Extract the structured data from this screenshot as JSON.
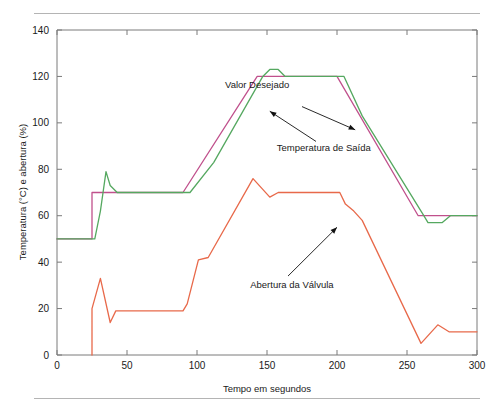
{
  "figure": {
    "rule_top_label": "top-divider",
    "rule_bottom_label": "bottom-divider"
  },
  "chart_data": {
    "type": "line",
    "title": "",
    "xlabel": "Tempo em segundos",
    "ylabel": "Temperatura (°C) e abertura (%)",
    "xlim": [
      0,
      300
    ],
    "ylim": [
      0,
      140
    ],
    "xticks": [
      0,
      50,
      100,
      150,
      200,
      250,
      300
    ],
    "yticks": [
      0,
      20,
      40,
      60,
      80,
      100,
      120,
      140
    ],
    "xtick_labels": [
      "0",
      "50",
      "100",
      "150",
      "200",
      "250",
      "300"
    ],
    "ytick_labels": [
      "0",
      "20",
      "40",
      "60",
      "80",
      "100",
      "120",
      "140"
    ],
    "grid": false,
    "legend": "none (inline annotations with arrows)",
    "series": [
      {
        "name": "Valor Desejado",
        "color": "#c0508c",
        "points": [
          [
            0,
            50
          ],
          [
            25,
            50
          ],
          [
            25,
            70
          ],
          [
            90,
            70
          ],
          [
            143,
            120
          ],
          [
            200,
            120
          ],
          [
            258,
            60
          ],
          [
            300,
            60
          ]
        ]
      },
      {
        "name": "Temperatura de Saída",
        "color": "#55a860",
        "points": [
          [
            0,
            50
          ],
          [
            27,
            50
          ],
          [
            31,
            62
          ],
          [
            35,
            79
          ],
          [
            38,
            73
          ],
          [
            43,
            70
          ],
          [
            95,
            70
          ],
          [
            112,
            83
          ],
          [
            147,
            120
          ],
          [
            152,
            123
          ],
          [
            158,
            123
          ],
          [
            163,
            120
          ],
          [
            205,
            120
          ],
          [
            218,
            103
          ],
          [
            262,
            60
          ],
          [
            265,
            57
          ],
          [
            275,
            57
          ],
          [
            281,
            60
          ],
          [
            300,
            60
          ]
        ]
      },
      {
        "name": "Abertura da Válvula",
        "color": "#e8694a",
        "points": [
          [
            25,
            0
          ],
          [
            25,
            20
          ],
          [
            31,
            33
          ],
          [
            38,
            14
          ],
          [
            42,
            19
          ],
          [
            90,
            19
          ],
          [
            93,
            22
          ],
          [
            101,
            41
          ],
          [
            108,
            42
          ],
          [
            140,
            76
          ],
          [
            152,
            68
          ],
          [
            158,
            70
          ],
          [
            168,
            70
          ],
          [
            202,
            70
          ],
          [
            206,
            65
          ],
          [
            212,
            62
          ],
          [
            218,
            58
          ],
          [
            260,
            5
          ],
          [
            272,
            13
          ],
          [
            280,
            10
          ],
          [
            300,
            10
          ]
        ]
      }
    ],
    "annotations": [
      {
        "text": "Valor Desejado",
        "label_x": 120,
        "label_y": 115,
        "arrow_from": [
          175,
          107
        ],
        "arrow_to": [
          213,
          97
        ]
      },
      {
        "text": "Temperatura de Saída",
        "label_x": 157,
        "label_y": 88,
        "arrow_from": [
          185,
          92
        ],
        "arrow_to": [
          152,
          105
        ]
      },
      {
        "text": "Abertura da Válvula",
        "label_x": 138,
        "label_y": 29,
        "arrow_from": [
          165,
          34
        ],
        "arrow_to": [
          200,
          55
        ]
      }
    ]
  }
}
